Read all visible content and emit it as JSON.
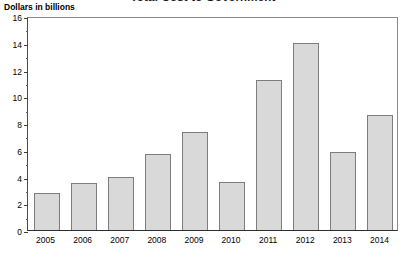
{
  "chart_data": {
    "type": "bar",
    "title": "Total Cost to Government",
    "subtitle": "",
    "xlabel": "",
    "ylabel": "Dollars in billions",
    "categories": [
      "2005",
      "2006",
      "2007",
      "2008",
      "2009",
      "2010",
      "2011",
      "2012",
      "2013",
      "2014"
    ],
    "values": [
      2.8,
      3.5,
      4.0,
      5.7,
      7.3,
      3.6,
      11.2,
      14.0,
      5.8,
      8.6
    ],
    "ylim": [
      0,
      16
    ],
    "y_major_ticks": [
      0,
      2,
      4,
      6,
      8,
      10,
      12,
      14,
      16
    ],
    "y_minor_ticks": [
      1,
      3,
      5,
      7,
      9,
      11,
      13,
      15
    ],
    "y_tick_labels": [
      "0",
      "2",
      "4",
      "6",
      "8",
      "10",
      "12",
      "14",
      "16"
    ],
    "grid": false,
    "legend": "none",
    "colors": {
      "bar_fill": "#d9d9d9",
      "bar_edge": "#7d7d7d",
      "axis": "#2e2e2e",
      "text": "#000000"
    }
  },
  "axis_caption": "Dollars in billions"
}
